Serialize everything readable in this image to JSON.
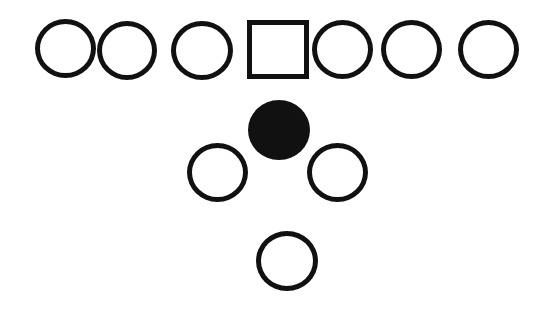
{
  "diagram": {
    "type": "football-formation",
    "background": "#ffffff",
    "stroke_color": "#111111",
    "offensive_line": [
      {
        "id": "player-1",
        "shape": "circle",
        "x": 35,
        "y": 19,
        "w": 61,
        "h": 59
      },
      {
        "id": "player-2",
        "shape": "circle",
        "x": 97,
        "y": 21,
        "w": 60,
        "h": 59
      },
      {
        "id": "player-3",
        "shape": "circle",
        "x": 171,
        "y": 21,
        "w": 62,
        "h": 59
      },
      {
        "id": "center",
        "shape": "square",
        "x": 247,
        "y": 20,
        "w": 62,
        "h": 59
      },
      {
        "id": "player-5",
        "shape": "circle",
        "x": 312,
        "y": 20,
        "w": 61,
        "h": 59
      },
      {
        "id": "player-6",
        "shape": "circle",
        "x": 381,
        "y": 20,
        "w": 61,
        "h": 59
      },
      {
        "id": "player-7",
        "shape": "circle",
        "x": 458,
        "y": 20,
        "w": 61,
        "h": 59
      }
    ],
    "backfield": [
      {
        "id": "quarterback",
        "shape": "filled-circle",
        "x": 248,
        "y": 100,
        "w": 62,
        "h": 60
      },
      {
        "id": "left-back",
        "shape": "circle",
        "x": 187,
        "y": 143,
        "w": 61,
        "h": 59
      },
      {
        "id": "right-back",
        "shape": "circle",
        "x": 307,
        "y": 143,
        "w": 61,
        "h": 59
      },
      {
        "id": "tailback",
        "shape": "circle",
        "x": 256,
        "y": 231,
        "w": 62,
        "h": 60
      }
    ]
  }
}
